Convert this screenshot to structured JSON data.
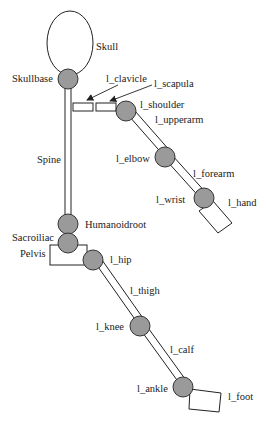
{
  "figure": {
    "type": "skeleton-hierarchy-diagram",
    "labels": {
      "skull": "Skull",
      "skullbase": "Skullbase",
      "l_clavicle": "l_clavicle",
      "l_scapula": "l_scapula",
      "l_shoulder": "l_shoulder",
      "l_upperarm": "l_upperarm",
      "spine": "Spine",
      "l_elbow": "l_elbow",
      "l_forearm": "l_forearm",
      "l_wrist": "l_wrist",
      "l_hand": "l_hand",
      "humanoidroot": "Humanoidroot",
      "sacroiliac": "Sacroiliac",
      "pelvis": "Pelvis",
      "l_hip": "l_hip",
      "l_thigh": "l_thigh",
      "l_knee": "l_knee",
      "l_calf": "l_calf",
      "l_ankle": "l_ankle",
      "l_foot": "l_foot"
    },
    "colors": {
      "joint_fill": "#9a9a9a",
      "stroke": "#222222",
      "segment_fill": "#ffffff"
    }
  }
}
